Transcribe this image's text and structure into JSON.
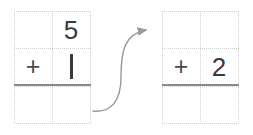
{
  "canvas": {
    "width": 253,
    "height": 135,
    "background": "#ffffff"
  },
  "colors": {
    "digit": "#3a3a3a",
    "operator": "#4a4a4a",
    "grid_line": "#cfcfcf",
    "answer_rule": "#8a8a8a",
    "arrow": "#9a9a9a"
  },
  "problems": {
    "before": {
      "name": "original-problem",
      "grid": {
        "columns": 2,
        "rows": 3
      },
      "cells": [
        {
          "row": 0,
          "col": 0,
          "text": ""
        },
        {
          "row": 0,
          "col": 1,
          "text": "5"
        },
        {
          "row": 1,
          "col": 0,
          "text": "+"
        },
        {
          "row": 1,
          "col": 1,
          "text": "1"
        },
        {
          "row": 2,
          "col": 0,
          "text": ""
        },
        {
          "row": 2,
          "col": 1,
          "text": ""
        }
      ],
      "top_addend": "5",
      "operator": "+",
      "bottom_addend": "1",
      "answer": ""
    },
    "after": {
      "name": "result-problem",
      "grid": {
        "columns": 2,
        "rows": 3
      },
      "cells": [
        {
          "row": 0,
          "col": 0,
          "text": ""
        },
        {
          "row": 0,
          "col": 1,
          "text": ""
        },
        {
          "row": 1,
          "col": 0,
          "text": "+"
        },
        {
          "row": 1,
          "col": 1,
          "text": "2"
        },
        {
          "row": 2,
          "col": 0,
          "text": ""
        },
        {
          "row": 2,
          "col": 1,
          "text": ""
        }
      ],
      "top_addend": "",
      "operator": "+",
      "bottom_addend": "2",
      "answer": ""
    }
  },
  "arrow": {
    "name": "transition-arrow",
    "direction": "left-to-right",
    "shape": "s-curve",
    "start": {
      "x": 93,
      "y": 111
    },
    "end": {
      "x": 152,
      "y": 30
    },
    "color": "#9a9a9a"
  }
}
